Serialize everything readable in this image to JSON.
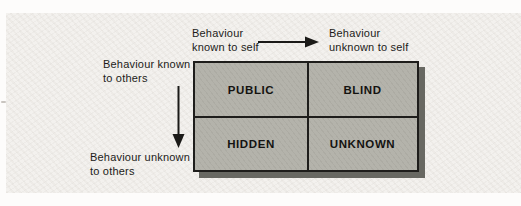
{
  "diagram": {
    "type": "johari-window-2x2-matrix",
    "labels": {
      "top_left": {
        "line1": "Behaviour",
        "line2": "known to self"
      },
      "top_right": {
        "line1": "Behaviour",
        "line2": "unknown to self"
      },
      "left_top": {
        "line1": "Behaviour known",
        "line2": "to others"
      },
      "left_bottom": {
        "line1": "Behaviour unknown",
        "line2": "to others"
      }
    },
    "quadrants": {
      "top_left": "PUBLIC",
      "top_right": "BLIND",
      "bottom_left": "HIDDEN",
      "bottom_right": "UNKNOWN"
    },
    "icons": {
      "horizontal_axis": "arrow-right-icon",
      "vertical_axis": "arrow-down-icon"
    },
    "colors": {
      "page_bg": "#fdfcfb",
      "panel_bg": "#f3f1ee",
      "grid_fill": "#b4b3ab",
      "grid_border": "#1e1d1b",
      "grid_shadow": "#686862",
      "text": "#1b1a18"
    }
  }
}
